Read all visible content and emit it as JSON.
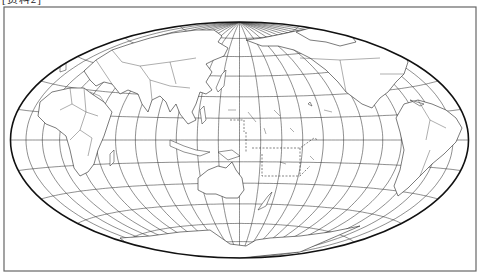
{
  "caption": "[资料2]",
  "map": {
    "projection": "equal-area elliptical world map",
    "central_meridian": "180°",
    "graticule_interval_deg": 15,
    "line_color": "#222222",
    "background": "#ffffff",
    "regions": [
      "Eurasia",
      "Africa",
      "Australia",
      "North America",
      "South America",
      "Antarctica",
      "Pacific Islands"
    ]
  }
}
